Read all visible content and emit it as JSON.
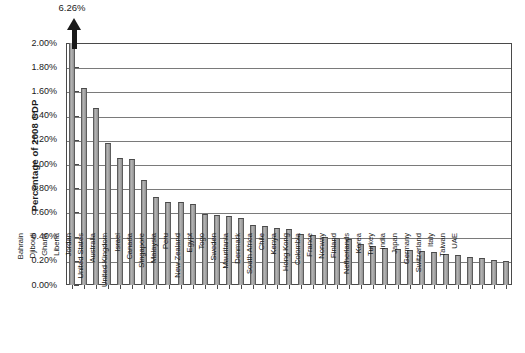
{
  "chart_data": {
    "type": "bar",
    "title": "",
    "subtitle": "",
    "xlabel": "",
    "ylabel": "Percentage of 2008 GDP",
    "ylim": [
      0,
      2.0
    ],
    "ytick_labels": [
      "0.00%",
      "0.20%",
      "0.40%",
      "0.60%",
      "0.80%",
      "1.00%",
      "1.20%",
      "1.40%",
      "1.60%",
      "1.80%",
      "2.00%"
    ],
    "ytick_values": [
      0,
      0.2,
      0.4,
      0.6,
      0.8,
      1.0,
      1.2,
      1.4,
      1.6,
      1.8,
      2.0
    ],
    "grid": true,
    "legend": null,
    "units": "percent",
    "annotations": [
      {
        "text": "6.26%",
        "category": "Bahrain",
        "note": "value exceeds axis maximum; bar drawn clipped with upward arrow"
      }
    ],
    "axis_break": {
      "category": "Bahrain",
      "true_value": 6.26,
      "display_clipped_at": 2.0
    },
    "categories": [
      "Bahrain",
      "Djibouti",
      "Ghana",
      "Liberia",
      "Jordan",
      "United States",
      "Australia",
      "United Kingdom",
      "Israel",
      "Canada",
      "Singapore",
      "Malaysia",
      "Peru",
      "New Zealand",
      "Egypt",
      "Togo",
      "Sweden",
      "Mauritania",
      "Denmark",
      "South Africa",
      "Chile",
      "Kenya",
      "Hong Kong",
      "Colombia",
      "France",
      "Norway",
      "Finland",
      "Netherlands",
      "Korea",
      "Turkey",
      "India",
      "Japan",
      "Germany",
      "Switzerland",
      "Italy",
      "Taiwan",
      "UAE"
    ],
    "values": [
      6.26,
      1.63,
      1.46,
      1.17,
      1.05,
      1.04,
      0.87,
      0.73,
      0.69,
      0.69,
      0.67,
      0.59,
      0.58,
      0.57,
      0.55,
      0.5,
      0.49,
      0.47,
      0.46,
      0.42,
      0.41,
      0.4,
      0.39,
      0.38,
      0.34,
      0.32,
      0.31,
      0.3,
      0.29,
      0.28,
      0.27,
      0.26,
      0.25,
      0.23,
      0.22,
      0.21,
      0.2
    ]
  },
  "colors": {
    "bar_fill": "#9d9d9d",
    "bar_edge": "#4a4a4a",
    "gridline": "#7a7a7a",
    "frame": "#4a4a4a",
    "background": "#ffffff",
    "text": "#1a1a1a",
    "arrow": "#1a1a1a"
  }
}
